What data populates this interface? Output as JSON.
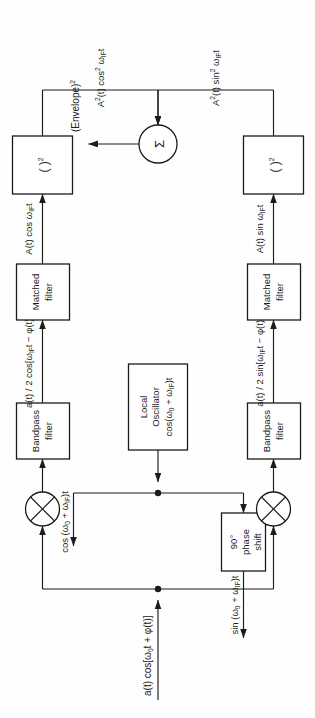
{
  "figure": {
    "orientation": "rotated-90-ccw",
    "blocks": {
      "bandpass_left": {
        "line1": "Bandpass",
        "line2": "filter"
      },
      "bandpass_right": {
        "line1": "Bandpass",
        "line2": "filter"
      },
      "matched_left": {
        "line1": "Matched",
        "line2": "filter"
      },
      "matched_right": {
        "line1": "Matched",
        "line2": "filter"
      },
      "squarer_left": {
        "label": "( )",
        "exponent": "2"
      },
      "squarer_right": {
        "label": "( )",
        "exponent": "2"
      },
      "local_oscillator": {
        "line1": "Local",
        "line2": "Oscillator",
        "line3": "cos(ω",
        "line3_sub": "0",
        "line3_mid": " + ω",
        "line3_sub2": "IF",
        "line3_end": ")t"
      },
      "phase_shift": {
        "line1": "90°",
        "line2": "phase",
        "line3": "shift"
      },
      "summer": {
        "symbol": "Σ"
      },
      "mixer_left": {
        "symbol": "⊗"
      },
      "mixer_right": {
        "symbol": "⊗"
      }
    },
    "signals": {
      "input": {
        "text": "a(t) cos[ω",
        "sub": "0",
        "mid": "t + φ(t)]"
      },
      "lo_cos": {
        "text": "cos (ω",
        "sub": "0",
        "mid": " + ω",
        "sub2": "IF",
        "end": ")t"
      },
      "lo_sin": {
        "text": "sin (ω",
        "sub": "0",
        "mid": " + ω",
        "sub2": "IF",
        "end": ")t"
      },
      "bp_out_left": {
        "num": "a(t)",
        "den": "2",
        "rest": "cos[ω",
        "sub": "IF",
        "tail": "t − φ(t)]"
      },
      "bp_out_right": {
        "num": "a(t)",
        "den": "2",
        "rest": "sin[ω",
        "sub": "IF",
        "tail": "t − φ(t)]"
      },
      "mf_out_left": {
        "text": "A(t) cos ω",
        "sub": "IF",
        "tail": "t"
      },
      "mf_out_right": {
        "text": "A(t) sin ω",
        "sub": "IF",
        "tail": "t"
      },
      "sq_out_left": {
        "text": "A",
        "sup": "2",
        "mid": "(t) cos",
        "sup2": "2",
        "tail": " ω",
        "sub": "IF",
        "end": "t"
      },
      "sq_out_right": {
        "text": "A",
        "sup": "2",
        "mid": "(t) sin",
        "sup2": "2",
        "tail": " ω",
        "sub": "IF",
        "end": "t"
      },
      "output": {
        "text": "(Envelope)",
        "sup": "2"
      }
    }
  },
  "colors": {
    "ink": "#1b1b1b",
    "paper": "#ffffff"
  }
}
